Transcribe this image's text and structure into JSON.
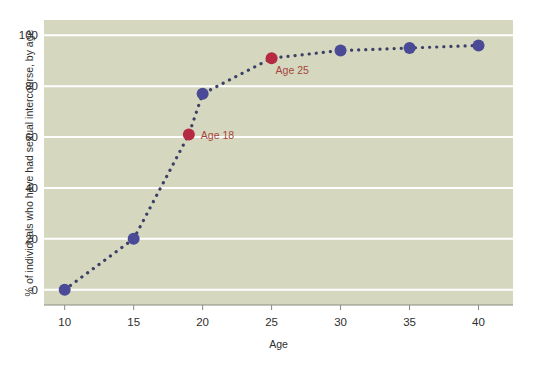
{
  "chart_data": {
    "type": "line",
    "title": "",
    "xlabel": "Age",
    "ylabel": "% of individuals who have had sexual intercourse, by age",
    "xlim": [
      8.5,
      42.5
    ],
    "ylim": [
      -6,
      106
    ],
    "xticks": [
      10,
      15,
      20,
      25,
      30,
      35,
      40
    ],
    "xtick_labels": [
      "10",
      "15",
      "20",
      "25",
      "30",
      "35",
      "40"
    ],
    "yticks": [
      0,
      20,
      40,
      60,
      80,
      100
    ],
    "ytick_labels": [
      "0",
      "20",
      "40",
      "60",
      "80",
      "100"
    ],
    "grid": "horizontal",
    "legend": "none",
    "x": [
      10,
      15,
      19,
      20,
      25,
      30,
      35,
      40
    ],
    "values": [
      0,
      20,
      61,
      77,
      91,
      94,
      95,
      96
    ],
    "series": [
      {
        "name": "% who have had sexual intercourse",
        "x": [
          10,
          15,
          19,
          20,
          25,
          30,
          35,
          40
        ],
        "values": [
          0,
          20,
          61,
          77,
          91,
          94,
          95,
          96
        ],
        "line_style": "dotted",
        "line_color": "#3c3f66",
        "marker_color": "#4a4a96"
      }
    ],
    "highlighted_points": [
      {
        "x": 19,
        "y": 61,
        "label": "Age 18",
        "color": "#b52a42"
      },
      {
        "x": 25,
        "y": 91,
        "label": "Age 25",
        "color": "#b52a42"
      }
    ],
    "annotations": [
      {
        "text": "Age 18",
        "x": 19,
        "y": 61
      },
      {
        "text": "Age 25",
        "x": 25,
        "y": 91
      }
    ],
    "colors": {
      "plot_background": "#d5d8be",
      "figure_background": "#ffffff",
      "gridline": "#ffffff",
      "axis_line": "#8a8a80",
      "marker_blue": "#4a4a96",
      "marker_red": "#b52a42",
      "line": "#3c3f66",
      "text": "#2e2e2e",
      "annotation_text": "#a8443f"
    }
  }
}
